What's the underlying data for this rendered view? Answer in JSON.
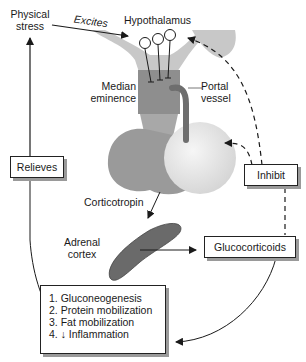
{
  "labels": {
    "physical_stress": [
      "Physical",
      "stress"
    ],
    "excites": "Excites",
    "hypothalamus": "Hypothalamus",
    "median_eminence": [
      "Median",
      "eminence"
    ],
    "portal_vessel": [
      "Portal",
      "vessel"
    ],
    "corticotropin": "Corticotropin",
    "adrenal_cortex": [
      "Adrenal",
      "cortex"
    ]
  },
  "boxes": {
    "relieves": "Relieves",
    "inhibit": "Inhibit",
    "glucocorticoids": "Glucocorticoids",
    "effects": [
      "1. Gluconeogenesis",
      "2. Protein mobilization",
      "3. Fat mobilization",
      "4. ↓ Inflammation"
    ]
  },
  "colors": {
    "hypothalamus_light": "#c8c8c8",
    "median_eminence": "#8e8e8e",
    "anterior_pituitary": "#9a9a9a",
    "posterior_pituitary": "#e6e6e6",
    "portal_vessel": "#6e6e6e",
    "adrenal": "#6a6a6a",
    "line": "#1a1a1a"
  }
}
